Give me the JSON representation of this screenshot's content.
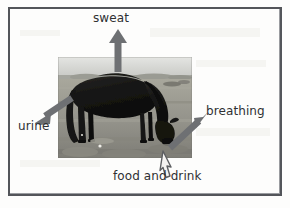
{
  "figure": {
    "type": "labeled-photo-diagram",
    "frame_color": "#53555a",
    "background_color": "#fdfdfc",
    "arrow_color": "#6e7073",
    "hollow_arrow_fill": "#f4f3f1",
    "hollow_arrow_stroke": "#5d5f62"
  },
  "photo": {
    "alt": "black horse grazing on grass with open sky and distant field",
    "x": 58,
    "y": 57,
    "width": 134,
    "height": 101,
    "sky_color": "#cfd0cd",
    "grass_color": "#9a9990",
    "horse_color": "#1d1c1b"
  },
  "labels": {
    "sweat": "sweat",
    "urine": "urine",
    "breathing": "breathing",
    "food_and_drink": "food and drink"
  },
  "arrows": [
    {
      "name": "sweat-arrow",
      "label": "sweat",
      "style": "solid",
      "direction": "up",
      "from": [
        118,
        72
      ],
      "to": [
        118,
        30
      ]
    },
    {
      "name": "urine-arrow",
      "label": "urine",
      "style": "solid",
      "direction": "down-left",
      "from": [
        72,
        98
      ],
      "to": [
        37,
        122
      ]
    },
    {
      "name": "breathing-arrow",
      "label": "breathing",
      "style": "solid",
      "direction": "up-right",
      "from": [
        170,
        148
      ],
      "to": [
        208,
        112
      ]
    },
    {
      "name": "food-and-drink-arrow",
      "label": "food and drink",
      "style": "hollow",
      "direction": "up-left",
      "from": [
        175,
        178
      ],
      "to": [
        163,
        152
      ]
    }
  ]
}
